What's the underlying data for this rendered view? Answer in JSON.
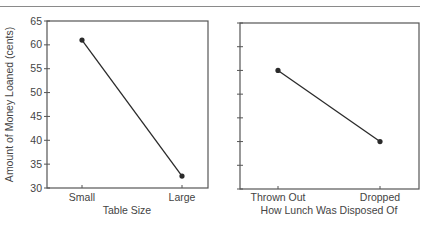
{
  "chart_data": [
    {
      "type": "line",
      "panel": "left",
      "title": "",
      "xlabel": "Table Size",
      "ylabel": "Amount of Money Loaned (cents)",
      "categories": [
        "Small",
        "Large"
      ],
      "values": [
        61,
        32.5
      ],
      "ylim": [
        30,
        65
      ],
      "yticks": [
        30,
        35,
        40,
        45,
        50,
        55,
        60,
        65
      ],
      "grid": false,
      "legend": null
    },
    {
      "type": "line",
      "panel": "right",
      "title": "",
      "xlabel": "How Lunch Was Disposed Of",
      "ylabel": "Amount of Money Loaned (cents)",
      "categories": [
        "Thrown Out",
        "Dropped"
      ],
      "values": [
        55,
        40
      ],
      "ylim": [
        30,
        65
      ],
      "yticks": [
        30,
        35,
        40,
        45,
        50,
        55,
        60,
        65
      ],
      "grid": false,
      "legend": null
    }
  ],
  "colors": {
    "line": "#2a2a2a",
    "axis": "#555555",
    "text": "#444444"
  }
}
